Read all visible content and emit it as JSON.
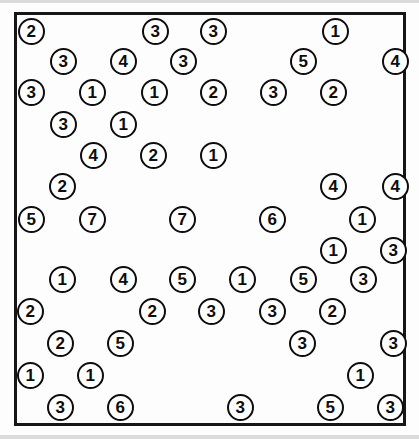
{
  "worksheet": {
    "title": "circled-number-grid-worksheet",
    "description": "Scanned worksheet page showing rows of hand-printed digits, each enclosed in a circle, inside a rectangular border.",
    "frame": {
      "x": 14,
      "y": 12,
      "width": 392,
      "height": 414,
      "border_width": 3,
      "border_color": "#161616"
    },
    "style": {
      "token_diameter": 27,
      "token_font_size": 17,
      "ink_color": "#0d0d0d",
      "paper_color": "#fdfdfd",
      "scan_edge_color": "#dcdcdc"
    },
    "rows": [
      {
        "row": 1,
        "y": 31,
        "tokens": [
          {
            "value": "2",
            "x": 31
          },
          {
            "value": "3",
            "x": 155
          },
          {
            "value": "3",
            "x": 213
          },
          {
            "value": "1",
            "x": 335
          }
        ]
      },
      {
        "row": 2,
        "y": 61,
        "tokens": [
          {
            "value": "3",
            "x": 63
          },
          {
            "value": "4",
            "x": 123
          },
          {
            "value": "3",
            "x": 183
          },
          {
            "value": "5",
            "x": 303
          },
          {
            "value": "4",
            "x": 395
          }
        ]
      },
      {
        "row": 3,
        "y": 92,
        "tokens": [
          {
            "value": "3",
            "x": 31
          },
          {
            "value": "1",
            "x": 92
          },
          {
            "value": "1",
            "x": 154
          },
          {
            "value": "2",
            "x": 213
          },
          {
            "value": "3",
            "x": 273
          },
          {
            "value": "2",
            "x": 333
          }
        ]
      },
      {
        "row": 4,
        "y": 124,
        "tokens": [
          {
            "value": "3",
            "x": 63
          },
          {
            "value": "1",
            "x": 123
          }
        ]
      },
      {
        "row": 5,
        "y": 155,
        "tokens": [
          {
            "value": "4",
            "x": 93
          },
          {
            "value": "2",
            "x": 153
          },
          {
            "value": "1",
            "x": 213
          }
        ]
      },
      {
        "row": 6,
        "y": 186,
        "tokens": [
          {
            "value": "2",
            "x": 62
          },
          {
            "value": "4",
            "x": 333
          },
          {
            "value": "4",
            "x": 395
          }
        ]
      },
      {
        "row": 7,
        "y": 219,
        "tokens": [
          {
            "value": "5",
            "x": 31
          },
          {
            "value": "7",
            "x": 92
          },
          {
            "value": "7",
            "x": 182
          },
          {
            "value": "6",
            "x": 272
          },
          {
            "value": "1",
            "x": 362
          }
        ]
      },
      {
        "row": 8,
        "y": 250,
        "tokens": [
          {
            "value": "1",
            "x": 333
          },
          {
            "value": "3",
            "x": 393
          }
        ]
      },
      {
        "row": 9,
        "y": 279,
        "tokens": [
          {
            "value": "1",
            "x": 62
          },
          {
            "value": "4",
            "x": 123
          },
          {
            "value": "5",
            "x": 182
          },
          {
            "value": "1",
            "x": 242
          },
          {
            "value": "5",
            "x": 303
          },
          {
            "value": "3",
            "x": 363
          }
        ]
      },
      {
        "row": 10,
        "y": 311,
        "tokens": [
          {
            "value": "2",
            "x": 30
          },
          {
            "value": "2",
            "x": 152
          },
          {
            "value": "3",
            "x": 211
          },
          {
            "value": "3",
            "x": 272
          },
          {
            "value": "2",
            "x": 332
          }
        ]
      },
      {
        "row": 11,
        "y": 343,
        "tokens": [
          {
            "value": "2",
            "x": 60
          },
          {
            "value": "5",
            "x": 120
          },
          {
            "value": "3",
            "x": 302
          },
          {
            "value": "3",
            "x": 393
          }
        ]
      },
      {
        "row": 12,
        "y": 375,
        "tokens": [
          {
            "value": "1",
            "x": 30
          },
          {
            "value": "1",
            "x": 90
          },
          {
            "value": "1",
            "x": 360
          }
        ]
      },
      {
        "row": 13,
        "y": 407,
        "tokens": [
          {
            "value": "3",
            "x": 60
          },
          {
            "value": "6",
            "x": 120
          },
          {
            "value": "3",
            "x": 240
          },
          {
            "value": "5",
            "x": 330
          },
          {
            "value": "3",
            "x": 390
          }
        ]
      }
    ]
  }
}
